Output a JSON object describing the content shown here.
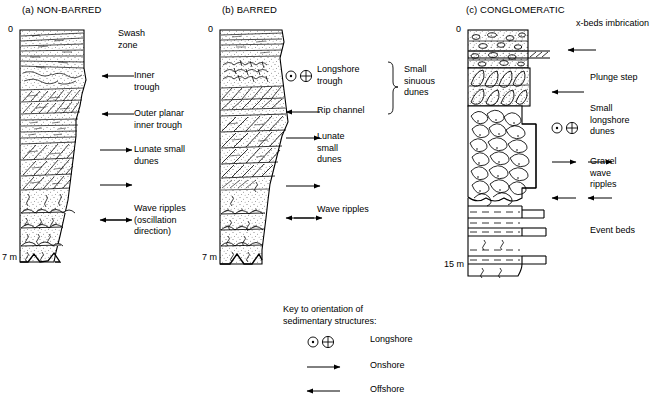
{
  "figure": {
    "background": "#ffffff",
    "ink": "#000000"
  },
  "columns": [
    {
      "id": "non-barred",
      "title": "(a) NON-BARRED",
      "depth_top": "0",
      "depth_bottom": "7 m",
      "annotations": [
        {
          "text": "Swash\nzone",
          "arrow": "none"
        },
        {
          "text": "Inner\ntrough",
          "arrow": "offshore"
        },
        {
          "text": "Outer planar\ninner trough",
          "arrow": "offshore"
        },
        {
          "text": "Lunate small\ndunes",
          "arrow": "onshore"
        },
        {
          "text": "",
          "arrow": "onshore"
        },
        {
          "text": "Wave ripples\n(oscillation\ndirection)",
          "arrow": "oscillation"
        }
      ]
    },
    {
      "id": "barred",
      "title": "(b) BARRED",
      "depth_top": "0",
      "depth_bottom": "7 m",
      "annotations": [
        {
          "text": "Longshore\ntrough",
          "arrow": "longshore"
        },
        {
          "text": "Rip channel",
          "arrow": "offshore"
        },
        {
          "text": "Lunate\nsmall\ndunes",
          "arrow": "onshore"
        },
        {
          "text": "",
          "arrow": "onshore"
        },
        {
          "text": "Wave ripples",
          "arrow": "none"
        },
        {
          "text": "",
          "arrow": "oscillation"
        }
      ],
      "brace_label": "Small\nsinuous\ndunes"
    },
    {
      "id": "conglomeratic",
      "title": "(c) CONGLOMERATIC",
      "depth_top": "0",
      "depth_bottom": "15 m",
      "annotations": [
        {
          "text": "x-beds imbrication",
          "arrow": "none"
        },
        {
          "text": "",
          "arrow": "offshore"
        },
        {
          "text": "Plunge step",
          "arrow": "offshore"
        },
        {
          "text": "Small\nlongshore\ndunes",
          "arrow": "longshore"
        },
        {
          "text": "",
          "arrow": "onshore-double"
        },
        {
          "text": "Gravel\nwave\nripples",
          "arrow": "none"
        },
        {
          "text": "",
          "arrow": "offshore-double"
        },
        {
          "text": "Event beds",
          "arrow": "none"
        }
      ]
    }
  ],
  "key": {
    "title": "Key to orientation of\nsedimentary structures:",
    "entries": [
      {
        "symbol": "longshore-symbol",
        "label": "Longshore"
      },
      {
        "symbol": "onshore-arrow",
        "label": "Onshore"
      },
      {
        "symbol": "offshore-arrow",
        "label": "Offshore"
      }
    ]
  }
}
